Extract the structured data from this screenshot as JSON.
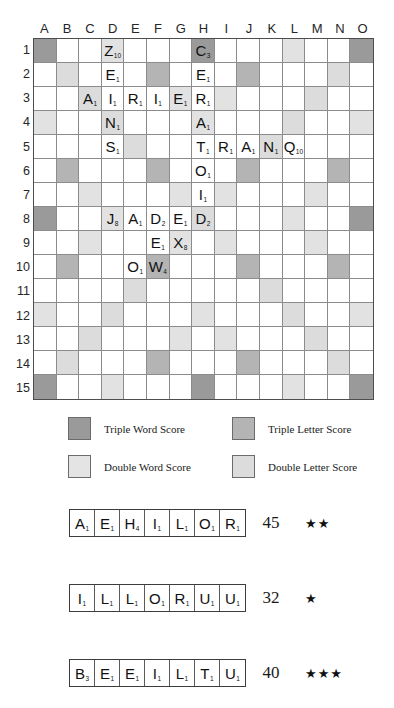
{
  "board": {
    "columns": [
      "A",
      "B",
      "C",
      "D",
      "E",
      "F",
      "G",
      "H",
      "I",
      "J",
      "K",
      "L",
      "M",
      "N",
      "O"
    ],
    "rows": [
      "1",
      "2",
      "3",
      "4",
      "5",
      "6",
      "7",
      "8",
      "9",
      "10",
      "11",
      "12",
      "13",
      "14",
      "15"
    ],
    "premium_colors": {
      "triple_word": "#9a9a9a",
      "triple_letter": "#b4b4b4",
      "double_word": "#dcdcdc",
      "double_letter": "#e2e2e2"
    },
    "premium_layout": [
      [
        "tws",
        "",
        "",
        "dls",
        "",
        "",
        "",
        "tws",
        "",
        "",
        "",
        "dls",
        "",
        "",
        "tws"
      ],
      [
        "",
        "dws",
        "",
        "",
        "",
        "tls",
        "",
        "",
        "",
        "tls",
        "",
        "",
        "",
        "dws",
        ""
      ],
      [
        "",
        "",
        "dws",
        "",
        "",
        "",
        "dls",
        "",
        "dls",
        "",
        "",
        "",
        "dws",
        "",
        ""
      ],
      [
        "dls",
        "",
        "",
        "dws",
        "",
        "",
        "",
        "dls",
        "",
        "",
        "",
        "dws",
        "",
        "",
        "dls"
      ],
      [
        "",
        "",
        "",
        "",
        "dws",
        "",
        "",
        "",
        "",
        "",
        "dws",
        "",
        "",
        "",
        ""
      ],
      [
        "",
        "tls",
        "",
        "",
        "",
        "tls",
        "",
        "",
        "",
        "tls",
        "",
        "",
        "",
        "tls",
        ""
      ],
      [
        "",
        "",
        "dls",
        "",
        "",
        "",
        "dls",
        "",
        "dls",
        "",
        "",
        "",
        "dls",
        "",
        ""
      ],
      [
        "tws",
        "",
        "",
        "dls",
        "",
        "",
        "",
        "dws",
        "",
        "",
        "",
        "dls",
        "",
        "",
        "tws"
      ],
      [
        "",
        "",
        "dls",
        "",
        "",
        "",
        "dls",
        "",
        "dls",
        "",
        "",
        "",
        "dls",
        "",
        ""
      ],
      [
        "",
        "tls",
        "",
        "",
        "",
        "tls",
        "",
        "",
        "",
        "tls",
        "",
        "",
        "",
        "tls",
        ""
      ],
      [
        "",
        "",
        "",
        "",
        "dws",
        "",
        "",
        "",
        "",
        "",
        "dws",
        "",
        "",
        "",
        ""
      ],
      [
        "dls",
        "",
        "",
        "dws",
        "",
        "",
        "",
        "dls",
        "",
        "",
        "",
        "dws",
        "",
        "",
        "dls"
      ],
      [
        "",
        "",
        "dws",
        "",
        "",
        "",
        "dls",
        "",
        "dls",
        "",
        "",
        "",
        "dws",
        "",
        ""
      ],
      [
        "",
        "dws",
        "",
        "",
        "",
        "tls",
        "",
        "",
        "",
        "tls",
        "",
        "",
        "",
        "dws",
        ""
      ],
      [
        "tws",
        "",
        "",
        "dls",
        "",
        "",
        "",
        "tws",
        "",
        "",
        "",
        "dls",
        "",
        "",
        "tws"
      ]
    ],
    "tiles": [
      {
        "row": 1,
        "col": "D",
        "letter": "Z",
        "points": "10"
      },
      {
        "row": 1,
        "col": "H",
        "letter": "C",
        "points": "3"
      },
      {
        "row": 2,
        "col": "D",
        "letter": "E",
        "points": "1"
      },
      {
        "row": 2,
        "col": "H",
        "letter": "E",
        "points": "1"
      },
      {
        "row": 3,
        "col": "C",
        "letter": "A",
        "points": "1"
      },
      {
        "row": 3,
        "col": "D",
        "letter": "I",
        "points": "1"
      },
      {
        "row": 3,
        "col": "E",
        "letter": "R",
        "points": "1"
      },
      {
        "row": 3,
        "col": "F",
        "letter": "I",
        "points": "1"
      },
      {
        "row": 3,
        "col": "G",
        "letter": "E",
        "points": "1"
      },
      {
        "row": 3,
        "col": "H",
        "letter": "R",
        "points": "1"
      },
      {
        "row": 4,
        "col": "D",
        "letter": "N",
        "points": "1"
      },
      {
        "row": 4,
        "col": "H",
        "letter": "A",
        "points": "1"
      },
      {
        "row": 5,
        "col": "D",
        "letter": "S",
        "points": "1"
      },
      {
        "row": 5,
        "col": "H",
        "letter": "T",
        "points": "1"
      },
      {
        "row": 5,
        "col": "I",
        "letter": "R",
        "points": "1"
      },
      {
        "row": 5,
        "col": "J",
        "letter": "A",
        "points": "1"
      },
      {
        "row": 5,
        "col": "K",
        "letter": "N",
        "points": "1"
      },
      {
        "row": 5,
        "col": "L",
        "letter": "Q",
        "points": "10"
      },
      {
        "row": 6,
        "col": "H",
        "letter": "O",
        "points": "1"
      },
      {
        "row": 7,
        "col": "H",
        "letter": "I",
        "points": "1"
      },
      {
        "row": 8,
        "col": "D",
        "letter": "J",
        "points": "8"
      },
      {
        "row": 8,
        "col": "E",
        "letter": "A",
        "points": "1"
      },
      {
        "row": 8,
        "col": "F",
        "letter": "D",
        "points": "2"
      },
      {
        "row": 8,
        "col": "G",
        "letter": "E",
        "points": "1"
      },
      {
        "row": 8,
        "col": "H",
        "letter": "D",
        "points": "2"
      },
      {
        "row": 9,
        "col": "F",
        "letter": "E",
        "points": "1"
      },
      {
        "row": 9,
        "col": "G",
        "letter": "X",
        "points": "8"
      },
      {
        "row": 10,
        "col": "E",
        "letter": "O",
        "points": "1"
      },
      {
        "row": 10,
        "col": "F",
        "letter": "W",
        "points": "4"
      }
    ]
  },
  "legend": {
    "triple_word_label": "Triple Word Score",
    "triple_letter_label": "Triple Letter Score",
    "double_word_label": "Double Word Score",
    "double_letter_label": "Double Letter Score"
  },
  "racks": [
    {
      "tiles": [
        {
          "letter": "A",
          "points": "1"
        },
        {
          "letter": "E",
          "points": "1"
        },
        {
          "letter": "H",
          "points": "4"
        },
        {
          "letter": "I",
          "points": "1"
        },
        {
          "letter": "L",
          "points": "1"
        },
        {
          "letter": "O",
          "points": "1"
        },
        {
          "letter": "R",
          "points": "1"
        }
      ],
      "score": "45",
      "stars": "★★"
    },
    {
      "tiles": [
        {
          "letter": "I",
          "points": "1"
        },
        {
          "letter": "L",
          "points": "1"
        },
        {
          "letter": "L",
          "points": "1"
        },
        {
          "letter": "O",
          "points": "1"
        },
        {
          "letter": "R",
          "points": "1"
        },
        {
          "letter": "U",
          "points": "1"
        },
        {
          "letter": "U",
          "points": "1"
        }
      ],
      "score": "32",
      "stars": "★"
    },
    {
      "tiles": [
        {
          "letter": "B",
          "points": "3"
        },
        {
          "letter": "E",
          "points": "1"
        },
        {
          "letter": "E",
          "points": "1"
        },
        {
          "letter": "I",
          "points": "1"
        },
        {
          "letter": "L",
          "points": "1"
        },
        {
          "letter": "T",
          "points": "1"
        },
        {
          "letter": "U",
          "points": "1"
        }
      ],
      "score": "40",
      "stars": "★★★"
    }
  ]
}
